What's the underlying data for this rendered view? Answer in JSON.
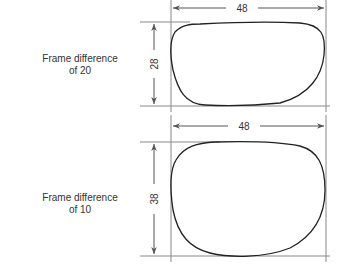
{
  "diagram": {
    "panels": [
      {
        "label_line1": "Frame difference",
        "label_line2": "of 20",
        "width_label": "48",
        "height_label": "28",
        "frame_difference": 20,
        "width": 48,
        "height": 28
      },
      {
        "label_line1": "Frame difference",
        "label_line2": "of 10",
        "width_label": "48",
        "height_label": "38",
        "frame_difference": 10,
        "width": 48,
        "height": 38
      }
    ],
    "colors": {
      "line": "#888888",
      "outline": "#222222",
      "text": "#333333"
    }
  }
}
